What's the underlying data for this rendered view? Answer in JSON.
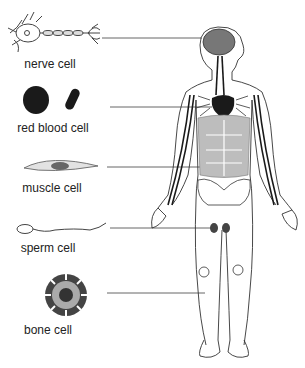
{
  "diagram": {
    "type": "labeled-illustration",
    "labels": [
      {
        "id": "nerve",
        "text": "nerve cell",
        "x": 50,
        "y": 55,
        "line_y": 38,
        "target": "brain"
      },
      {
        "id": "rbc",
        "text": "red blood cell",
        "x": 53,
        "y": 121,
        "line_y": 107,
        "target": "heart"
      },
      {
        "id": "muscle",
        "text": "muscle cell",
        "x": 52,
        "y": 181,
        "line_y": 167,
        "target": "abdominal muscle"
      },
      {
        "id": "sperm",
        "text": "sperm cell",
        "x": 48,
        "y": 241,
        "line_y": 228,
        "target": "testes"
      },
      {
        "id": "bone",
        "text": "bone cell",
        "x": 48,
        "y": 323,
        "line_y": 293,
        "target": "leg bone"
      }
    ],
    "colors": {
      "line": "#555555",
      "dark": "#1a1a1a",
      "muscle_fill": "#bdbdbd",
      "outline": "#333333"
    }
  }
}
